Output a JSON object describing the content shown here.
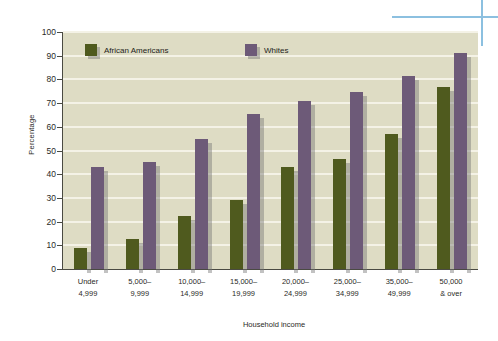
{
  "chart_data": {
    "type": "bar",
    "title": "",
    "xlabel": "Household income",
    "ylabel": "Percentage",
    "ylim": [
      0,
      100
    ],
    "ytick_step": 10,
    "yticks": [
      0,
      10,
      20,
      30,
      40,
      50,
      60,
      70,
      80,
      90,
      100
    ],
    "ytick_labels": [
      "0",
      "10",
      "20",
      "30",
      "40",
      "50",
      "60",
      "70",
      "80",
      "90",
      "100"
    ],
    "grid": true,
    "legend_position": "upper-left-inside",
    "categories": [
      "Under\n4,999",
      "5,000–\n9,999",
      "10,000–\n14,999",
      "15,000–\n19,999",
      "20,000–\n24,999",
      "25,000–\n34,999",
      "35,000–\n49,999",
      "50,000\n& over"
    ],
    "categories_lines": [
      [
        "Under",
        "4,999"
      ],
      [
        "5,000–",
        "9,999"
      ],
      [
        "10,000–",
        "14,999"
      ],
      [
        "15,000–",
        "19,999"
      ],
      [
        "20,000–",
        "24,999"
      ],
      [
        "25,000–",
        "34,999"
      ],
      [
        "35,000–",
        "49,999"
      ],
      [
        "50,000",
        "& over"
      ]
    ],
    "series": [
      {
        "name": "African Americans",
        "color": "#4f5a1e",
        "values": [
          9,
          12.5,
          22.5,
          29,
          43,
          46.5,
          57,
          77
        ]
      },
      {
        "name": "Whites",
        "color": "#6d5a78",
        "values": [
          43,
          45,
          55,
          65.5,
          71,
          74.5,
          81.5,
          91
        ]
      }
    ],
    "plot_background": "#dedcc4",
    "gridline_color": "#f4f2e6",
    "accent_rule_color": "#8cc0e0"
  }
}
